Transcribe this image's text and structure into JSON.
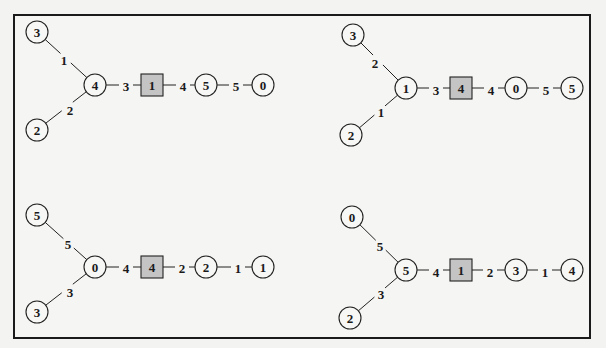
{
  "diagrams": [
    {
      "name": "top-left",
      "nodes": [
        {
          "id": "a",
          "label": "3",
          "shape": "circle",
          "x": 37,
          "y": 32
        },
        {
          "id": "b",
          "label": "4",
          "shape": "circle",
          "x": 95,
          "y": 85
        },
        {
          "id": "c",
          "label": "1",
          "shape": "square",
          "x": 152,
          "y": 85
        },
        {
          "id": "d",
          "label": "5",
          "shape": "circle",
          "x": 206,
          "y": 85
        },
        {
          "id": "e",
          "label": "0",
          "shape": "circle",
          "x": 263,
          "y": 85
        },
        {
          "id": "f",
          "label": "2",
          "shape": "circle",
          "x": 37,
          "y": 130
        }
      ],
      "edges": [
        {
          "from": "a",
          "to": "b",
          "label": "1",
          "lx": 64,
          "ly": 60
        },
        {
          "from": "b",
          "to": "c",
          "label": "3",
          "lx": 126,
          "ly": 86
        },
        {
          "from": "c",
          "to": "d",
          "label": "4",
          "lx": 183,
          "ly": 86
        },
        {
          "from": "d",
          "to": "e",
          "label": "5",
          "lx": 236,
          "ly": 86
        },
        {
          "from": "f",
          "to": "b",
          "label": "2",
          "lx": 70,
          "ly": 110
        }
      ]
    },
    {
      "name": "top-right",
      "nodes": [
        {
          "id": "a",
          "label": "3",
          "shape": "circle",
          "x": 353,
          "y": 35
        },
        {
          "id": "b",
          "label": "1",
          "shape": "circle",
          "x": 406,
          "y": 88
        },
        {
          "id": "c",
          "label": "4",
          "shape": "square",
          "x": 461,
          "y": 88
        },
        {
          "id": "d",
          "label": "0",
          "shape": "circle",
          "x": 516,
          "y": 88
        },
        {
          "id": "e",
          "label": "5",
          "shape": "circle",
          "x": 572,
          "y": 88
        },
        {
          "id": "f",
          "label": "2",
          "shape": "circle",
          "x": 351,
          "y": 135
        }
      ],
      "edges": [
        {
          "from": "a",
          "to": "b",
          "label": "2",
          "lx": 375,
          "ly": 63
        },
        {
          "from": "b",
          "to": "c",
          "label": "3",
          "lx": 436,
          "ly": 90
        },
        {
          "from": "c",
          "to": "d",
          "label": "4",
          "lx": 491,
          "ly": 90
        },
        {
          "from": "d",
          "to": "e",
          "label": "5",
          "lx": 546,
          "ly": 90
        },
        {
          "from": "f",
          "to": "b",
          "label": "1",
          "lx": 381,
          "ly": 112
        }
      ]
    },
    {
      "name": "bottom-left",
      "nodes": [
        {
          "id": "a",
          "label": "5",
          "shape": "circle",
          "x": 37,
          "y": 215
        },
        {
          "id": "b",
          "label": "0",
          "shape": "circle",
          "x": 95,
          "y": 267
        },
        {
          "id": "c",
          "label": "4",
          "shape": "square",
          "x": 152,
          "y": 267
        },
        {
          "id": "d",
          "label": "2",
          "shape": "circle",
          "x": 206,
          "y": 267
        },
        {
          "id": "e",
          "label": "1",
          "shape": "circle",
          "x": 263,
          "y": 267
        },
        {
          "id": "f",
          "label": "3",
          "shape": "circle",
          "x": 37,
          "y": 312
        }
      ],
      "edges": [
        {
          "from": "a",
          "to": "b",
          "label": "5",
          "lx": 68,
          "ly": 244
        },
        {
          "from": "b",
          "to": "c",
          "label": "4",
          "lx": 126,
          "ly": 268
        },
        {
          "from": "c",
          "to": "d",
          "label": "2",
          "lx": 182,
          "ly": 268
        },
        {
          "from": "d",
          "to": "e",
          "label": "1",
          "lx": 238,
          "ly": 268
        },
        {
          "from": "f",
          "to": "b",
          "label": "3",
          "lx": 70,
          "ly": 292
        }
      ]
    },
    {
      "name": "bottom-right",
      "nodes": [
        {
          "id": "a",
          "label": "0",
          "shape": "circle",
          "x": 352,
          "y": 217
        },
        {
          "id": "b",
          "label": "5",
          "shape": "circle",
          "x": 406,
          "y": 270
        },
        {
          "id": "c",
          "label": "1",
          "shape": "square",
          "x": 461,
          "y": 270
        },
        {
          "id": "d",
          "label": "3",
          "shape": "circle",
          "x": 516,
          "y": 270
        },
        {
          "id": "e",
          "label": "4",
          "shape": "circle",
          "x": 572,
          "y": 270
        },
        {
          "id": "f",
          "label": "2",
          "shape": "circle",
          "x": 350,
          "y": 318
        }
      ],
      "edges": [
        {
          "from": "a",
          "to": "b",
          "label": "5",
          "lx": 380,
          "ly": 246
        },
        {
          "from": "b",
          "to": "c",
          "label": "4",
          "lx": 436,
          "ly": 272
        },
        {
          "from": "c",
          "to": "d",
          "label": "2",
          "lx": 490,
          "ly": 272
        },
        {
          "from": "d",
          "to": "e",
          "label": "1",
          "lx": 545,
          "ly": 272
        },
        {
          "from": "f",
          "to": "b",
          "label": "3",
          "lx": 381,
          "ly": 294
        }
      ]
    }
  ],
  "style": {
    "square_fill": "#c4c4c4",
    "circle_fill": "#f7f7f5",
    "stroke": "#222222",
    "background": "#f3f3f1"
  }
}
